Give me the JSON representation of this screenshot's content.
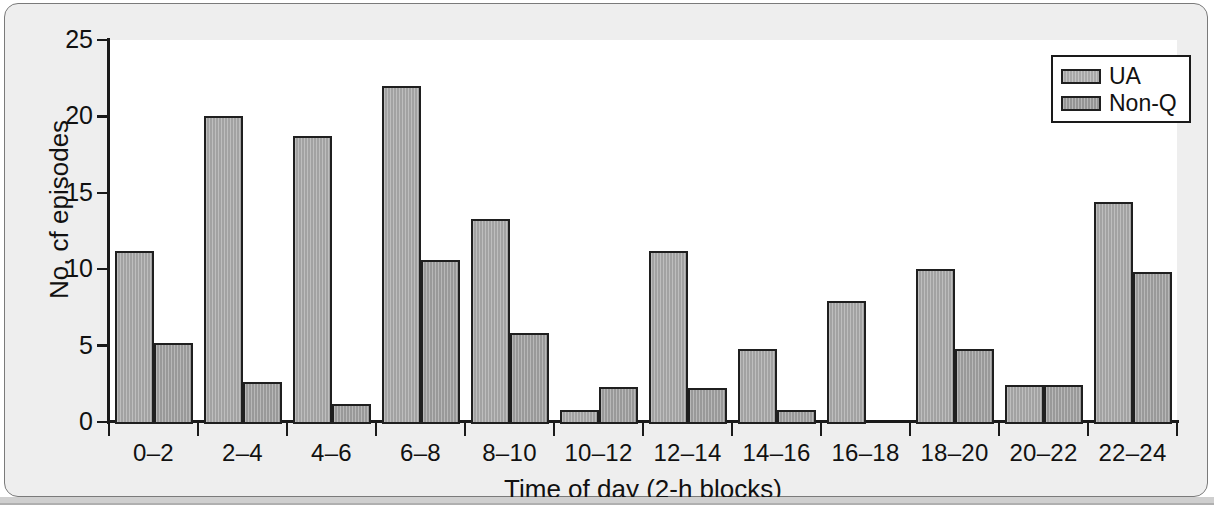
{
  "figure": {
    "background_color": "#eeeeee",
    "plot_background_color": "#ffffff",
    "axis_color": "#1a1a1a",
    "bar_fill_color": "#9d9d9d",
    "bar_edge_color": "#1f1f1f"
  },
  "chart_data": {
    "type": "bar",
    "title": "",
    "xlabel": "Time of day (2-h blocks)",
    "ylabel": "No. cf episodes",
    "categories": [
      "0–2",
      "2–4",
      "4–6",
      "6–8",
      "8–10",
      "10–12",
      "12–14",
      "14–16",
      "16–18",
      "18–20",
      "20–22",
      "22–24"
    ],
    "series": [
      {
        "name": "UA",
        "values": [
          11.2,
          20.0,
          18.7,
          22.0,
          13.3,
          0.8,
          11.2,
          4.8,
          7.9,
          10.0,
          2.4,
          14.4
        ]
      },
      {
        "name": "Non-Q",
        "values": [
          5.2,
          2.6,
          1.2,
          10.6,
          5.8,
          2.3,
          2.2,
          0.8,
          0.0,
          4.8,
          2.4,
          9.8
        ]
      }
    ],
    "ylim": [
      0,
      25
    ],
    "yticks": [
      0,
      5,
      10,
      15,
      20,
      25
    ],
    "ytick_labels": [
      "0",
      "5",
      "10",
      "15",
      "20",
      "25"
    ],
    "grid": false,
    "legend_position": "top-right",
    "legend_entries": [
      "UA",
      "Non-Q"
    ]
  }
}
